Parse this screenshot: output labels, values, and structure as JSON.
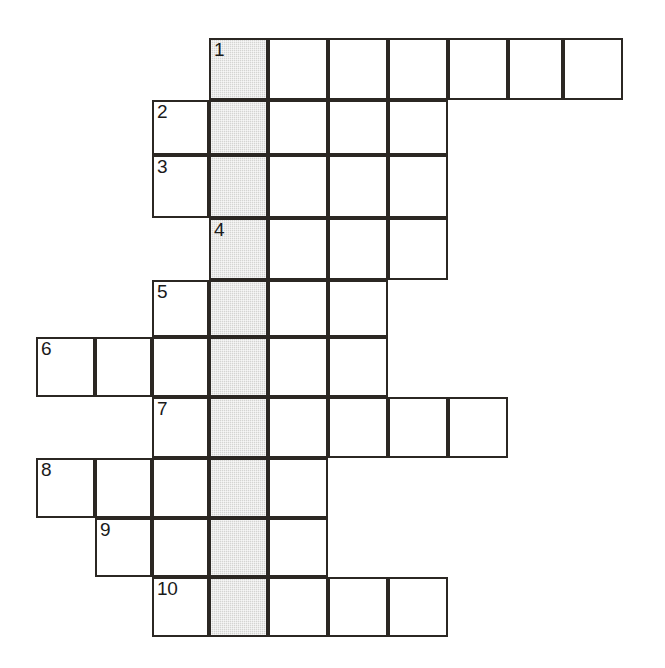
{
  "puzzle": {
    "type": "crossword-grid",
    "title": "",
    "colors": {
      "grid_line": "#2b2723",
      "cell_fill": "#ffffff",
      "shaded_fill": "#d4d4d2",
      "number_text": "#1a1a1a",
      "page_background": "#ffffff"
    },
    "metrics": {
      "cell_width": 59,
      "cell_height": 60,
      "border_width": 2,
      "shaded_column_index": 3
    },
    "column_x": [
      36,
      95,
      152,
      209,
      268,
      328,
      388,
      448,
      508,
      563,
      623
    ],
    "row_y": [
      38,
      100,
      155,
      218,
      280,
      337,
      397,
      458,
      518,
      577,
      637
    ],
    "rows": [
      {
        "number": "1",
        "index": 0,
        "y": 38,
        "height": 62,
        "start_col": 3,
        "cell_count": 7,
        "cells": [
          {
            "x": 209,
            "w": 59,
            "shaded": true,
            "number": "1"
          },
          {
            "x": 268,
            "w": 60,
            "shaded": false,
            "number": ""
          },
          {
            "x": 328,
            "w": 60,
            "shaded": false,
            "number": ""
          },
          {
            "x": 388,
            "w": 60,
            "shaded": false,
            "number": ""
          },
          {
            "x": 448,
            "w": 60,
            "shaded": false,
            "number": ""
          },
          {
            "x": 508,
            "w": 55,
            "shaded": false,
            "number": ""
          },
          {
            "x": 563,
            "w": 60,
            "shaded": false,
            "number": ""
          }
        ]
      },
      {
        "number": "2",
        "index": 1,
        "y": 100,
        "height": 55,
        "start_col": 2,
        "cell_count": 5,
        "cells": [
          {
            "x": 152,
            "w": 57,
            "shaded": false,
            "number": "2"
          },
          {
            "x": 209,
            "w": 59,
            "shaded": true,
            "number": ""
          },
          {
            "x": 268,
            "w": 60,
            "shaded": false,
            "number": ""
          },
          {
            "x": 328,
            "w": 60,
            "shaded": false,
            "number": ""
          },
          {
            "x": 388,
            "w": 60,
            "shaded": false,
            "number": ""
          }
        ]
      },
      {
        "number": "3",
        "index": 2,
        "y": 155,
        "height": 63,
        "start_col": 2,
        "cell_count": 5,
        "cells": [
          {
            "x": 152,
            "w": 57,
            "shaded": false,
            "number": "3"
          },
          {
            "x": 209,
            "w": 59,
            "shaded": true,
            "number": ""
          },
          {
            "x": 268,
            "w": 60,
            "shaded": false,
            "number": ""
          },
          {
            "x": 328,
            "w": 60,
            "shaded": false,
            "number": ""
          },
          {
            "x": 388,
            "w": 60,
            "shaded": false,
            "number": ""
          }
        ]
      },
      {
        "number": "4",
        "index": 3,
        "y": 218,
        "height": 62,
        "start_col": 3,
        "cell_count": 4,
        "cells": [
          {
            "x": 209,
            "w": 59,
            "shaded": true,
            "number": "4"
          },
          {
            "x": 268,
            "w": 60,
            "shaded": false,
            "number": ""
          },
          {
            "x": 328,
            "w": 60,
            "shaded": false,
            "number": ""
          },
          {
            "x": 388,
            "w": 60,
            "shaded": false,
            "number": ""
          }
        ]
      },
      {
        "number": "5",
        "index": 4,
        "y": 280,
        "height": 57,
        "start_col": 2,
        "cell_count": 4,
        "cells": [
          {
            "x": 152,
            "w": 57,
            "shaded": false,
            "number": "5"
          },
          {
            "x": 209,
            "w": 59,
            "shaded": true,
            "number": ""
          },
          {
            "x": 268,
            "w": 60,
            "shaded": false,
            "number": ""
          },
          {
            "x": 328,
            "w": 60,
            "shaded": false,
            "number": ""
          }
        ]
      },
      {
        "number": "6",
        "index": 5,
        "y": 337,
        "height": 60,
        "start_col": 0,
        "cell_count": 6,
        "cells": [
          {
            "x": 36,
            "w": 59,
            "shaded": false,
            "number": "6"
          },
          {
            "x": 95,
            "w": 57,
            "shaded": false,
            "number": ""
          },
          {
            "x": 152,
            "w": 57,
            "shaded": false,
            "number": ""
          },
          {
            "x": 209,
            "w": 59,
            "shaded": true,
            "number": ""
          },
          {
            "x": 268,
            "w": 60,
            "shaded": false,
            "number": ""
          },
          {
            "x": 328,
            "w": 60,
            "shaded": false,
            "number": ""
          }
        ]
      },
      {
        "number": "7",
        "index": 6,
        "y": 397,
        "height": 61,
        "start_col": 2,
        "cell_count": 6,
        "cells": [
          {
            "x": 152,
            "w": 57,
            "shaded": false,
            "number": "7"
          },
          {
            "x": 209,
            "w": 59,
            "shaded": true,
            "number": ""
          },
          {
            "x": 268,
            "w": 60,
            "shaded": false,
            "number": ""
          },
          {
            "x": 328,
            "w": 60,
            "shaded": false,
            "number": ""
          },
          {
            "x": 388,
            "w": 60,
            "shaded": false,
            "number": ""
          },
          {
            "x": 448,
            "w": 60,
            "shaded": false,
            "number": ""
          }
        ]
      },
      {
        "number": "8",
        "index": 7,
        "y": 458,
        "height": 60,
        "start_col": 0,
        "cell_count": 5,
        "cells": [
          {
            "x": 36,
            "w": 59,
            "shaded": false,
            "number": "8"
          },
          {
            "x": 95,
            "w": 57,
            "shaded": false,
            "number": ""
          },
          {
            "x": 152,
            "w": 57,
            "shaded": false,
            "number": ""
          },
          {
            "x": 209,
            "w": 59,
            "shaded": true,
            "number": ""
          },
          {
            "x": 268,
            "w": 60,
            "shaded": false,
            "number": ""
          }
        ]
      },
      {
        "number": "9",
        "index": 8,
        "y": 518,
        "height": 59,
        "start_col": 1,
        "cell_count": 4,
        "cells": [
          {
            "x": 95,
            "w": 57,
            "shaded": false,
            "number": "9"
          },
          {
            "x": 152,
            "w": 57,
            "shaded": false,
            "number": ""
          },
          {
            "x": 209,
            "w": 59,
            "shaded": true,
            "number": ""
          },
          {
            "x": 268,
            "w": 60,
            "shaded": false,
            "number": ""
          }
        ]
      },
      {
        "number": "10",
        "index": 9,
        "y": 577,
        "height": 60,
        "start_col": 2,
        "cell_count": 5,
        "cells": [
          {
            "x": 152,
            "w": 57,
            "shaded": false,
            "number": "10"
          },
          {
            "x": 209,
            "w": 59,
            "shaded": true,
            "number": ""
          },
          {
            "x": 268,
            "w": 60,
            "shaded": false,
            "number": ""
          },
          {
            "x": 328,
            "w": 60,
            "shaded": false,
            "number": ""
          },
          {
            "x": 388,
            "w": 60,
            "shaded": false,
            "number": ""
          }
        ]
      }
    ],
    "clue_numbers": [
      "1",
      "2",
      "3",
      "4",
      "5",
      "6",
      "7",
      "8",
      "9",
      "10"
    ]
  }
}
